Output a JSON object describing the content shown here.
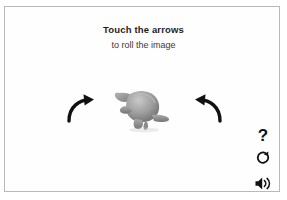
{
  "app": {
    "screen_name": "roll-the-image-activity",
    "background_color": "#ffffff",
    "frame_border_color": "#b9b9b9"
  },
  "instruction": {
    "title": "Touch the arrows",
    "subtitle": "to roll the image",
    "title_color": "#1d1d1d",
    "subtitle_color": "#3a3a3a"
  },
  "stage": {
    "object": {
      "icon": "turtle-3d-model",
      "label": "turtle",
      "color": "#8e8e8e"
    },
    "arrows": [
      {
        "icon": "curved-arrow-right-icon",
        "label": "Roll right",
        "direction": "right",
        "color": "#111111"
      },
      {
        "icon": "curved-arrow-left-icon",
        "label": "Roll left",
        "direction": "left",
        "color": "#111111"
      }
    ]
  },
  "controls": [
    {
      "icon": "question-mark-icon",
      "label": "?",
      "name": "help"
    },
    {
      "icon": "refresh-circle-icon",
      "label": "Replay",
      "name": "replay"
    },
    {
      "icon": "speaker-volume-icon",
      "label": "Sound",
      "name": "sound"
    }
  ]
}
